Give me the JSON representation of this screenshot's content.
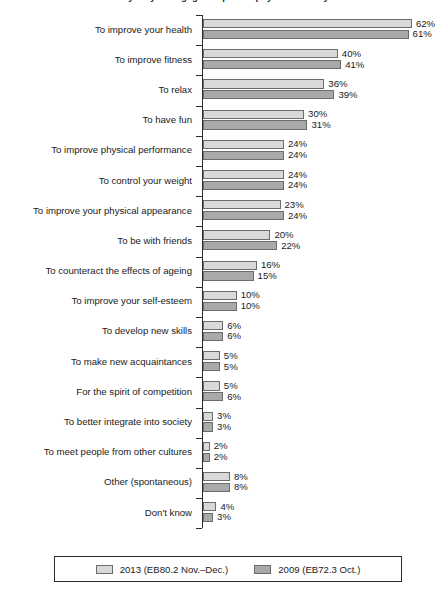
{
  "chart_data": {
    "type": "bar",
    "orientation": "horizontal",
    "title": "Why do you engage in sport or physical activity?",
    "xlabel": "",
    "ylabel": "",
    "xlim": [
      0,
      62
    ],
    "grid": false,
    "value_suffix": "%",
    "legend_position": "bottom",
    "categories": [
      "To improve your health",
      "To improve fitness",
      "To relax",
      "To have fun",
      "To improve physical performance",
      "To control your weight",
      "To improve your physical appearance",
      "To be with friends",
      "To counteract the effects of ageing",
      "To improve your self-esteem",
      "To develop new skills",
      "To make new acquaintances",
      "For the spirit of competition",
      "To better integrate into society",
      "To meet people from other cultures",
      "Other (spontaneous)",
      "Don't know"
    ],
    "series": [
      {
        "name": "2013 (EB80.2 Nov.–Dec.)",
        "color": "#d9d9d9",
        "values": [
          62,
          40,
          36,
          30,
          24,
          24,
          23,
          20,
          16,
          10,
          6,
          5,
          5,
          3,
          2,
          8,
          4
        ],
        "labels": [
          "62%",
          "40%",
          "36%",
          "30%",
          "24%",
          "24%",
          "23%",
          "20%",
          "16%",
          "10%",
          "6%",
          "5%",
          "5%",
          "3%",
          "2%",
          "8%",
          "4%"
        ]
      },
      {
        "name": "2009 (EB72.3 Oct.)",
        "color": "#a9a9a9",
        "values": [
          61,
          41,
          39,
          31,
          24,
          24,
          24,
          22,
          15,
          10,
          6,
          5,
          6,
          3,
          2,
          8,
          3
        ],
        "labels": [
          "61%",
          "41%",
          "39%",
          "31%",
          "24%",
          "24%",
          "24%",
          "22%",
          "15%",
          "10%",
          "6%",
          "5%",
          "6%",
          "3%",
          "2%",
          "8%",
          "3%"
        ]
      }
    ]
  },
  "legend": {
    "entries": [
      {
        "label": "2013 (EB80.2 Nov.–Dec.)",
        "swatch": "light-gray-swatch-icon"
      },
      {
        "label": "2009 (EB72.3 Oct.)",
        "swatch": "dark-gray-swatch-icon"
      }
    ]
  }
}
